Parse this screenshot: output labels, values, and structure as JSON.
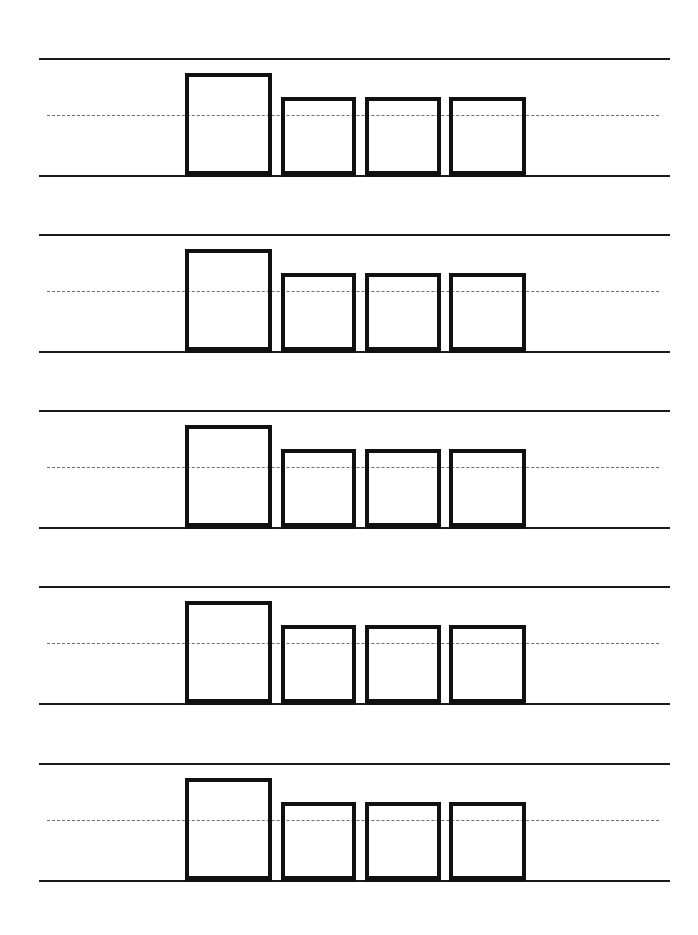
{
  "page": {
    "type": "handwriting-practice-worksheet",
    "background_color": "#ffffff",
    "line_color": "#1a1a1a",
    "dashed_line_color": "#6e6e6e",
    "box_border_color": "#111111"
  },
  "rows": [
    {
      "index": 1,
      "boxes": [
        {
          "kind": "tall",
          "text": ""
        },
        {
          "kind": "short",
          "text": ""
        },
        {
          "kind": "short",
          "text": ""
        },
        {
          "kind": "short",
          "text": ""
        }
      ]
    },
    {
      "index": 2,
      "boxes": [
        {
          "kind": "tall",
          "text": ""
        },
        {
          "kind": "short",
          "text": ""
        },
        {
          "kind": "short",
          "text": ""
        },
        {
          "kind": "short",
          "text": ""
        }
      ]
    },
    {
      "index": 3,
      "boxes": [
        {
          "kind": "tall",
          "text": ""
        },
        {
          "kind": "short",
          "text": ""
        },
        {
          "kind": "short",
          "text": ""
        },
        {
          "kind": "short",
          "text": ""
        }
      ]
    },
    {
      "index": 4,
      "boxes": [
        {
          "kind": "tall",
          "text": ""
        },
        {
          "kind": "short",
          "text": ""
        },
        {
          "kind": "short",
          "text": ""
        },
        {
          "kind": "short",
          "text": ""
        }
      ]
    },
    {
      "index": 5,
      "boxes": [
        {
          "kind": "tall",
          "text": ""
        },
        {
          "kind": "short",
          "text": ""
        },
        {
          "kind": "short",
          "text": ""
        },
        {
          "kind": "short",
          "text": ""
        }
      ]
    }
  ]
}
